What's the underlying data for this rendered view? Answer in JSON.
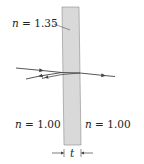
{
  "diagram": {
    "slab": {
      "fill": "#d9d9d9",
      "edge": "#8a8a8a",
      "index_label": {
        "symbol": "n",
        "eq": " = ",
        "value": "1.35"
      }
    },
    "left_medium": {
      "symbol": "n",
      "eq": " = ",
      "value": "1.00"
    },
    "right_medium": {
      "symbol": "n",
      "eq": " = ",
      "value": "1.00"
    },
    "thickness": {
      "symbol": "t"
    },
    "ray_color": "#444444"
  }
}
